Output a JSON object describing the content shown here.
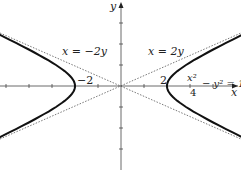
{
  "chart_data": {
    "type": "line",
    "title": "",
    "xlabel": "x",
    "ylabel": "y",
    "series": [
      {
        "name": "x^2/4 - y^2 = 1",
        "kind": "hyperbola",
        "style": "solid-bold"
      },
      {
        "name": "x = 2y",
        "kind": "asymptote",
        "style": "dotted"
      },
      {
        "name": "x = -2y",
        "kind": "asymptote",
        "style": "dotted"
      }
    ],
    "annotations": [
      "x = -2y",
      "x = 2y",
      "-2",
      "2"
    ],
    "xlim": [
      -5.2,
      5.2
    ],
    "ylim": [
      -4,
      4
    ],
    "grid": false,
    "legend": "none"
  },
  "labels": {
    "y_axis": "y",
    "x_axis": "x",
    "asym_neg": "x = −2y",
    "asym_pos": "x = 2y",
    "tick_neg2": "−2",
    "tick_pos2": "2",
    "eq_num": "x²",
    "eq_den": "4",
    "eq_rest": "− y² = 1"
  }
}
